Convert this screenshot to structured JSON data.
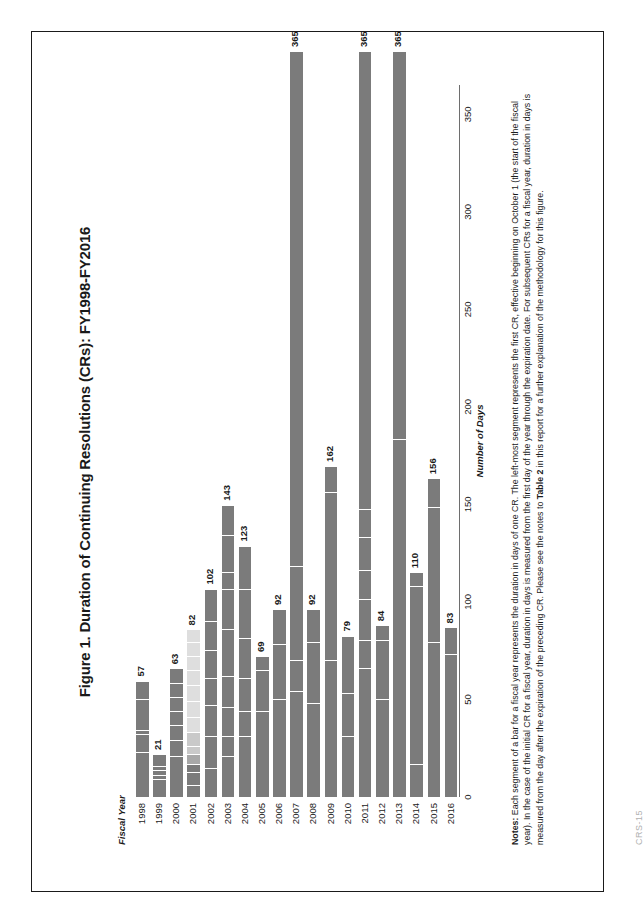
{
  "page": {
    "footer": "CRS-15"
  },
  "figure": {
    "title": "Figure 1. Duration of Continuing Resolutions (CRs): FY1998-FY2016",
    "y_axis_title": "Fiscal Year",
    "x_axis_title": "Number of Days"
  },
  "notes": {
    "label": "Notes:",
    "text_1": " Each segment of a bar for a fiscal year represents the duration in days of one CR. The left-most segment represents the first CR, effective beginning on October 1 (the start of the fiscal year). In the case of the initial CR for a fiscal year, duration in days is measured from the first day of the year through the expiration date. For subsequent CRs for a fiscal year, duration in days is measured from the day after the expiration of the preceding CR. Please see the notes to ",
    "bold_ref": "Table 2",
    "text_2": " in this report for a further explanation of the methodology for this figure."
  },
  "chart_data": {
    "type": "bar",
    "orientation": "horizontal",
    "stacked": true,
    "title": "Figure 1. Duration of Continuing Resolutions (CRs): FY1998-FY2016",
    "xlabel": "Number of Days",
    "ylabel": "Fiscal Year",
    "xlim": [
      0,
      365
    ],
    "xticks": [
      0,
      50,
      100,
      150,
      200,
      250,
      300,
      350
    ],
    "xtick_labels": [
      "0",
      "50",
      "100",
      "150",
      "200",
      "250",
      "300",
      "350"
    ],
    "grid": false,
    "legend": "none",
    "categories": [
      "1998",
      "1999",
      "2000",
      "2001",
      "2002",
      "2003",
      "2004",
      "2005",
      "2006",
      "2007",
      "2008",
      "2009",
      "2010",
      "2011",
      "2012",
      "2013",
      "2014",
      "2015",
      "2016"
    ],
    "values": [
      57,
      21,
      63,
      82,
      102,
      143,
      123,
      69,
      92,
      365,
      92,
      162,
      79,
      365,
      84,
      365,
      110,
      156,
      83
    ],
    "value_labels": [
      "57",
      "21",
      "63",
      "82",
      "102",
      "143",
      "123",
      "69",
      "92",
      "365",
      "92",
      "162",
      "79",
      "365",
      "84",
      "365",
      "110",
      "156",
      "83"
    ],
    "segments": [
      {
        "year": "1998",
        "total": 57,
        "durations": [
          22,
          9,
          2,
          15,
          9
        ],
        "shades": [
          "dark",
          "dark",
          "dark",
          "dark",
          "dark"
        ]
      },
      {
        "year": "1999",
        "total": 21,
        "durations": [
          9,
          2,
          2,
          2,
          6
        ],
        "shades": [
          "dark",
          "dark",
          "dark",
          "dark",
          "dark"
        ]
      },
      {
        "year": "2000",
        "total": 63,
        "durations": [
          20,
          8,
          7,
          7,
          7,
          7,
          7
        ],
        "shades": [
          "dark",
          "dark",
          "dark",
          "dark",
          "dark",
          "dark",
          "dark"
        ]
      },
      {
        "year": "2001",
        "total": 82,
        "durations": [
          6,
          6,
          4,
          5,
          4,
          7,
          7,
          8,
          8,
          7,
          7,
          7,
          6
        ],
        "shades": [
          "dark",
          "dark",
          "dark",
          "mid",
          "light",
          "light",
          "light2",
          "light2",
          "light2",
          "light2",
          "light2",
          "light2",
          "light2"
        ]
      },
      {
        "year": "2002",
        "total": 102,
        "durations": [
          14,
          16,
          15,
          13,
          14,
          14,
          16
        ],
        "shades": [
          "dark",
          "dark",
          "dark",
          "dark",
          "dark",
          "dark",
          "dark"
        ]
      },
      {
        "year": "2003",
        "total": 143,
        "durations": [
          20,
          10,
          14,
          15,
          23,
          20,
          8,
          18,
          15
        ],
        "shades": [
          "dark",
          "dark",
          "dark",
          "dark",
          "dark",
          "dark",
          "dark",
          "dark",
          "dark"
        ]
      },
      {
        "year": "2004",
        "total": 123,
        "durations": [
          30,
          12,
          16,
          20,
          24,
          21
        ],
        "shades": [
          "dark",
          "dark",
          "dark",
          "dark",
          "dark",
          "dark"
        ]
      },
      {
        "year": "2005",
        "total": 69,
        "durations": [
          42,
          20,
          7
        ],
        "shades": [
          "dark",
          "dark",
          "dark"
        ]
      },
      {
        "year": "2006",
        "total": 92,
        "durations": [
          48,
          27,
          17
        ],
        "shades": [
          "dark",
          "dark",
          "dark"
        ]
      },
      {
        "year": "2007",
        "total": 365,
        "durations": [
          52,
          15,
          46,
          252
        ],
        "shades": [
          "dark",
          "dark",
          "dark",
          "dark"
        ]
      },
      {
        "year": "2008",
        "total": 92,
        "durations": [
          46,
          30,
          16
        ],
        "shades": [
          "dark",
          "dark",
          "dark"
        ]
      },
      {
        "year": "2009",
        "total": 162,
        "durations": [
          67,
          82,
          13
        ],
        "shades": [
          "dark",
          "dark",
          "dark"
        ]
      },
      {
        "year": "2010",
        "total": 79,
        "durations": [
          30,
          21,
          28
        ],
        "shades": [
          "dark",
          "dark",
          "dark"
        ]
      },
      {
        "year": "2011",
        "total": 365,
        "durations": [
          63,
          14,
          20,
          14,
          16,
          14,
          224
        ],
        "shades": [
          "dark",
          "dark",
          "dark",
          "dark",
          "dark",
          "dark",
          "dark"
        ]
      },
      {
        "year": "2012",
        "total": 84,
        "durations": [
          48,
          29,
          7
        ],
        "shades": [
          "dark",
          "dark",
          "dark"
        ]
      },
      {
        "year": "2013",
        "total": 365,
        "durations": [
          175,
          190
        ],
        "shades": [
          "dark",
          "dark"
        ]
      },
      {
        "year": "2014",
        "total": 110,
        "durations": [
          16,
          87,
          7
        ],
        "shades": [
          "dark",
          "dark",
          "dark"
        ]
      },
      {
        "year": "2015",
        "total": 156,
        "durations": [
          76,
          66,
          14
        ],
        "shades": [
          "dark",
          "dark",
          "dark"
        ]
      },
      {
        "year": "2016",
        "total": 83,
        "durations": [
          70,
          13
        ],
        "shades": [
          "dark",
          "dark"
        ]
      }
    ]
  }
}
